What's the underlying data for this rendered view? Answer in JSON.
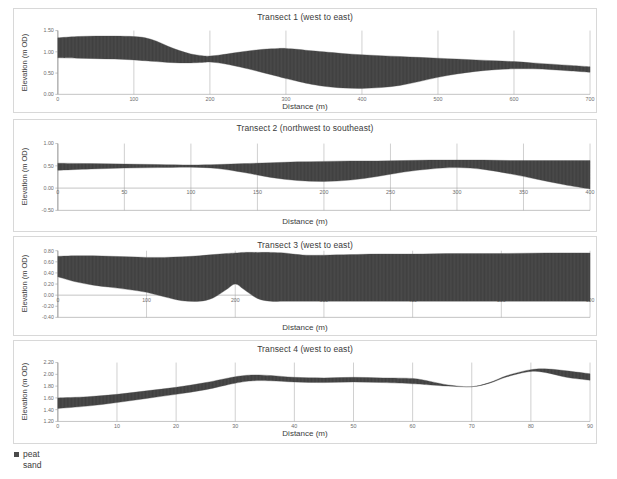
{
  "figure": {
    "legend": {
      "items": [
        {
          "label": "peat",
          "color": "#4a4a4a",
          "name": "peat"
        },
        {
          "label": "sand",
          "color": "#ffffff",
          "name": "sand"
        }
      ]
    }
  },
  "chart_data": [
    {
      "type": "area",
      "title": "Transect 1 (west to east)",
      "xlabel": "Distance (m)",
      "ylabel": "Elevation (m OD)",
      "xlim": [
        0,
        700
      ],
      "ylim": [
        0.0,
        1.5
      ],
      "xticks": [
        0,
        100,
        200,
        300,
        400,
        500,
        600,
        700
      ],
      "xticklabels": [
        "0",
        "100",
        "200",
        "300",
        "400",
        "500",
        "600",
        "700"
      ],
      "yticks": [
        0.0,
        0.5,
        1.0,
        1.5
      ],
      "yticklabels": [
        "0.00",
        "0.50",
        "1.00",
        "1.50"
      ],
      "grid": "vertical-only",
      "legend_position": "below-figure",
      "series": [
        {
          "name": "peat top",
          "x": [
            0,
            25,
            50,
            75,
            100,
            115,
            130,
            145,
            160,
            175,
            190,
            200,
            215,
            230,
            250,
            270,
            290,
            300,
            315,
            330,
            350,
            375,
            400,
            425,
            450,
            475,
            500,
            525,
            550,
            575,
            600,
            625,
            650,
            675,
            700
          ],
          "values": [
            1.33,
            1.36,
            1.37,
            1.37,
            1.36,
            1.33,
            1.25,
            1.13,
            1.03,
            0.95,
            0.91,
            0.9,
            0.93,
            0.97,
            1.02,
            1.06,
            1.08,
            1.08,
            1.06,
            1.03,
            1.0,
            0.96,
            0.93,
            0.91,
            0.89,
            0.87,
            0.85,
            0.83,
            0.81,
            0.79,
            0.77,
            0.74,
            0.71,
            0.68,
            0.65
          ]
        },
        {
          "name": "peat base / sand top",
          "x": [
            0,
            25,
            50,
            75,
            100,
            115,
            130,
            145,
            160,
            175,
            190,
            200,
            215,
            230,
            250,
            270,
            290,
            300,
            315,
            330,
            350,
            375,
            400,
            425,
            450,
            475,
            500,
            525,
            550,
            575,
            600,
            625,
            650,
            675,
            700
          ],
          "values": [
            0.86,
            0.85,
            0.84,
            0.83,
            0.81,
            0.79,
            0.77,
            0.75,
            0.74,
            0.74,
            0.75,
            0.76,
            0.73,
            0.68,
            0.6,
            0.51,
            0.42,
            0.37,
            0.31,
            0.25,
            0.19,
            0.15,
            0.14,
            0.16,
            0.21,
            0.3,
            0.4,
            0.48,
            0.54,
            0.58,
            0.6,
            0.6,
            0.58,
            0.55,
            0.52
          ]
        }
      ]
    },
    {
      "type": "area",
      "title": "Transect 2 (northwest to southeast)",
      "xlabel": "Distance (m)",
      "ylabel": "Elevation (m OD)",
      "xlim": [
        0,
        400
      ],
      "ylim": [
        -0.5,
        1.0
      ],
      "xticks": [
        0,
        50,
        100,
        150,
        200,
        250,
        300,
        350,
        400
      ],
      "xticklabels": [
        "0",
        "50",
        "100",
        "150",
        "200",
        "250",
        "300",
        "350",
        "400"
      ],
      "yticks": [
        -0.5,
        0.0,
        0.5,
        1.0
      ],
      "yticklabels": [
        "-0.50",
        "0.00",
        "0.50",
        "1.00"
      ],
      "grid": "vertical-only",
      "legend_position": "below-figure",
      "series": [
        {
          "name": "peat top",
          "x": [
            0,
            25,
            50,
            75,
            100,
            120,
            140,
            160,
            180,
            200,
            220,
            240,
            260,
            280,
            300,
            320,
            340,
            360,
            380,
            400
          ],
          "values": [
            0.56,
            0.55,
            0.54,
            0.53,
            0.52,
            0.53,
            0.55,
            0.57,
            0.59,
            0.6,
            0.61,
            0.61,
            0.62,
            0.63,
            0.63,
            0.63,
            0.62,
            0.62,
            0.62,
            0.62
          ]
        },
        {
          "name": "peat base / sand top",
          "x": [
            0,
            25,
            50,
            75,
            100,
            120,
            140,
            160,
            180,
            200,
            220,
            240,
            260,
            280,
            300,
            320,
            340,
            360,
            380,
            400
          ],
          "values": [
            0.4,
            0.43,
            0.45,
            0.46,
            0.47,
            0.44,
            0.35,
            0.24,
            0.17,
            0.15,
            0.18,
            0.26,
            0.36,
            0.43,
            0.46,
            0.42,
            0.32,
            0.2,
            0.08,
            -0.02
          ]
        }
      ]
    },
    {
      "type": "area",
      "title": "Transect 3 (west to east)",
      "xlabel": "Distance (m)",
      "ylabel": "Elevation (m OD)",
      "xlim": [
        0,
        600
      ],
      "ylim": [
        -0.4,
        0.8
      ],
      "xticks": [
        0,
        100,
        200,
        300,
        400,
        500,
        600
      ],
      "xticklabels": [
        "0",
        "100",
        "200",
        "300",
        "400",
        "500",
        "600"
      ],
      "yticks": [
        -0.4,
        -0.2,
        0.0,
        0.2,
        0.4,
        0.6,
        0.8
      ],
      "yticklabels": [
        "-0.40",
        "-0.20",
        "0.00",
        "0.20",
        "0.40",
        "0.60",
        "0.80"
      ],
      "grid": "vertical-only",
      "legend_position": "below-figure",
      "series": [
        {
          "name": "peat top",
          "x": [
            0,
            20,
            40,
            60,
            80,
            100,
            120,
            140,
            160,
            175,
            190,
            200,
            210,
            225,
            240,
            255,
            265,
            280,
            300,
            330,
            360,
            400,
            450,
            500,
            550,
            600
          ],
          "values": [
            0.7,
            0.71,
            0.71,
            0.7,
            0.69,
            0.68,
            0.68,
            0.69,
            0.71,
            0.73,
            0.75,
            0.76,
            0.77,
            0.77,
            0.77,
            0.76,
            0.74,
            0.72,
            0.72,
            0.73,
            0.74,
            0.74,
            0.75,
            0.75,
            0.76,
            0.76
          ]
        },
        {
          "name": "peat base / sand top",
          "x": [
            0,
            20,
            40,
            60,
            80,
            100,
            120,
            140,
            160,
            175,
            190,
            200,
            210,
            225,
            240,
            255,
            265,
            280,
            300,
            330,
            360,
            400,
            450,
            500,
            550,
            600
          ],
          "values": [
            0.33,
            0.24,
            0.18,
            0.14,
            0.1,
            0.05,
            -0.03,
            -0.1,
            -0.11,
            -0.05,
            0.1,
            0.2,
            0.1,
            -0.06,
            -0.11,
            -0.11,
            -0.11,
            -0.11,
            -0.11,
            -0.11,
            -0.11,
            -0.11,
            -0.11,
            -0.11,
            -0.11,
            -0.11
          ]
        }
      ]
    },
    {
      "type": "area",
      "title": "Transect 4 (west to east)",
      "xlabel": "Distance (m)",
      "ylabel": "Elevation (m OD)",
      "xlim": [
        0,
        90
      ],
      "ylim": [
        1.2,
        2.2
      ],
      "xticks": [
        0,
        10,
        20,
        30,
        40,
        50,
        60,
        70,
        80,
        90
      ],
      "xticklabels": [
        "0",
        "10",
        "20",
        "30",
        "40",
        "50",
        "60",
        "70",
        "80",
        "90"
      ],
      "yticks": [
        1.2,
        1.4,
        1.6,
        1.8,
        2.0,
        2.2
      ],
      "yticklabels": [
        "1.20",
        "1.40",
        "1.60",
        "1.80",
        "2.00",
        "2.20"
      ],
      "grid": "vertical-only",
      "legend_position": "below-figure",
      "series": [
        {
          "name": "peat top",
          "x": [
            0,
            5,
            10,
            15,
            20,
            25,
            30,
            33,
            36,
            40,
            45,
            50,
            55,
            60,
            63,
            66,
            70,
            73,
            76,
            80,
            83,
            86,
            90
          ],
          "values": [
            1.6,
            1.62,
            1.66,
            1.72,
            1.78,
            1.86,
            1.96,
            1.99,
            1.98,
            1.95,
            1.94,
            1.95,
            1.94,
            1.93,
            1.88,
            1.82,
            1.79,
            1.86,
            1.98,
            2.08,
            2.09,
            2.06,
            2.01
          ]
        },
        {
          "name": "peat base / sand top",
          "x": [
            0,
            5,
            10,
            15,
            20,
            25,
            30,
            33,
            36,
            40,
            45,
            50,
            55,
            60,
            63,
            66,
            70,
            73,
            76,
            80,
            83,
            86,
            90
          ],
          "values": [
            1.42,
            1.46,
            1.52,
            1.59,
            1.66,
            1.74,
            1.85,
            1.89,
            1.89,
            1.87,
            1.86,
            1.87,
            1.86,
            1.84,
            1.82,
            1.8,
            1.79,
            1.85,
            1.96,
            2.05,
            2.02,
            1.95,
            1.9
          ]
        }
      ]
    }
  ]
}
